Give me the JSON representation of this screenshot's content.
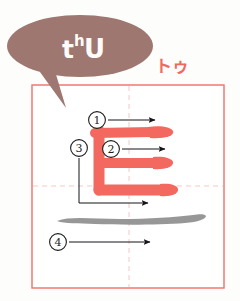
{
  "page": {
    "background_color": "#fdfdfc"
  },
  "speech_bubble": {
    "name": "pronunciation-bubble",
    "fill_color": "#9d7770",
    "romaji": "tʰU",
    "romaji_base": "t",
    "romaji_superscript": "h",
    "romaji_tail": "U",
    "text_color": "#fdfcfa"
  },
  "kana_label": {
    "text": "トゥ",
    "color": "#f2685f",
    "font_size": "17px"
  },
  "frame": {
    "name": "character-grid-frame",
    "border_color": "#ef6f68",
    "guide_color": "#f3c9c4",
    "x": 32,
    "y": 85,
    "width": 192,
    "height": 203,
    "guide_x": 129,
    "guide_y": 186
  },
  "character": {
    "glyph": "トゥ",
    "stroke_color_active": "#f4695f",
    "stroke_color_done": "#8d8d8d",
    "total_strokes": 4
  },
  "strokes": [
    {
      "number": "①",
      "label": "1",
      "color": "#f4695f",
      "marker_x": 97,
      "marker_y": 120,
      "arrow_from_x": 108,
      "arrow_from_y": 120,
      "arrow_to_x": 155,
      "arrow_to_y": 120
    },
    {
      "number": "②",
      "label": "2",
      "color": "#f4695f",
      "marker_x": 111,
      "marker_y": 149,
      "arrow_from_x": 122,
      "arrow_from_y": 149,
      "arrow_to_x": 165,
      "arrow_to_y": 149
    },
    {
      "number": "③",
      "label": "3",
      "color": "#f4695f",
      "marker_x": 79,
      "marker_y": 148,
      "arrow_from_x": 79,
      "arrow_from_y": 159,
      "arrow_to_x": 148,
      "arrow_to_y": 203
    },
    {
      "number": "④",
      "label": "4",
      "color": "#8d8d8d",
      "marker_x": 58,
      "marker_y": 242,
      "arrow_from_x": 69,
      "arrow_from_y": 242,
      "arrow_to_x": 150,
      "arrow_to_y": 242
    }
  ],
  "arrow_color": "#15151a"
}
